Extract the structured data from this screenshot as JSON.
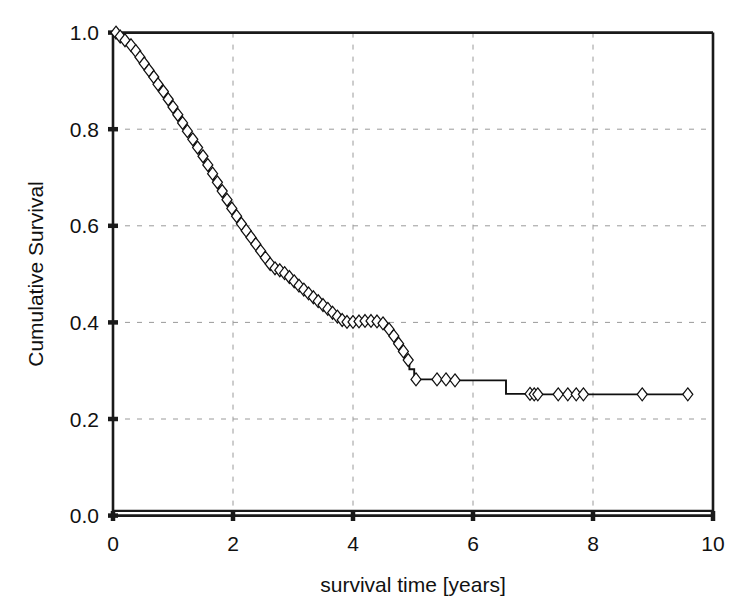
{
  "chart_data": {
    "type": "line",
    "subtype": "kaplan-meier-survival-step",
    "title": "",
    "xlabel": "survival time [years]",
    "ylabel": "Cumulative Survival",
    "xlim": [
      0,
      10
    ],
    "ylim": [
      0.0,
      1.0
    ],
    "xticks": [
      0,
      2,
      4,
      6,
      8,
      10
    ],
    "xtick_labels": [
      "0",
      "2",
      "4",
      "6",
      "8",
      "10"
    ],
    "yticks": [
      0.0,
      0.2,
      0.4,
      0.6,
      0.8,
      1.0
    ],
    "ytick_labels": [
      "0.0",
      "0.2",
      "0.4",
      "0.6",
      "0.8",
      "1.0"
    ],
    "grid": true,
    "grid_style": "dashed",
    "grid_color": "#9a9a9a",
    "legend": "none",
    "line_color": "#101010",
    "marker": "open-diamond",
    "marker_meaning": "censored observation",
    "series": [
      {
        "name": "Cumulative Survival",
        "x": [
          0.0,
          0.08,
          0.16,
          0.24,
          0.32,
          0.4,
          0.48,
          0.56,
          0.64,
          0.72,
          0.8,
          0.88,
          0.96,
          1.04,
          1.12,
          1.2,
          1.28,
          1.36,
          1.44,
          1.52,
          1.6,
          1.68,
          1.76,
          1.84,
          1.92,
          2.0,
          2.08,
          2.16,
          2.24,
          2.32,
          2.4,
          2.48,
          2.56,
          2.64,
          2.72,
          2.8,
          2.88,
          2.96,
          3.04,
          3.12,
          3.2,
          3.28,
          3.36,
          3.44,
          3.52,
          3.6,
          3.68,
          3.76,
          3.84,
          3.95,
          4.05,
          4.15,
          4.25,
          4.35,
          4.45,
          4.55,
          4.62,
          4.7,
          4.78,
          4.86,
          4.94,
          5.02,
          5.6,
          6.2,
          6.55,
          7.0,
          7.5,
          8.0,
          8.8,
          9.6
        ],
        "y": [
          1.0,
          0.992,
          0.984,
          0.974,
          0.962,
          0.949,
          0.936,
          0.922,
          0.908,
          0.893,
          0.878,
          0.862,
          0.846,
          0.83,
          0.813,
          0.796,
          0.779,
          0.762,
          0.744,
          0.726,
          0.708,
          0.69,
          0.672,
          0.654,
          0.636,
          0.62,
          0.604,
          0.59,
          0.576,
          0.562,
          0.548,
          0.534,
          0.521,
          0.512,
          0.508,
          0.502,
          0.494,
          0.485,
          0.476,
          0.468,
          0.46,
          0.452,
          0.444,
          0.436,
          0.428,
          0.42,
          0.412,
          0.405,
          0.401,
          0.401,
          0.402,
          0.403,
          0.403,
          0.402,
          0.398,
          0.386,
          0.372,
          0.356,
          0.34,
          0.322,
          0.303,
          0.282,
          0.28,
          0.28,
          0.252,
          0.251,
          0.251,
          0.251,
          0.251,
          0.251
        ]
      }
    ],
    "censored_x": [
      0.05,
      0.12,
      0.2,
      0.3,
      0.38,
      0.45,
      0.52,
      0.6,
      0.68,
      0.75,
      0.84,
      0.92,
      1.0,
      1.08,
      1.16,
      1.24,
      1.33,
      1.41,
      1.5,
      1.58,
      1.66,
      1.74,
      1.82,
      1.9,
      1.98,
      2.06,
      2.14,
      2.22,
      2.3,
      2.38,
      2.46,
      2.54,
      2.62,
      2.7,
      2.78,
      2.86,
      2.94,
      3.02,
      3.1,
      3.18,
      3.26,
      3.34,
      3.42,
      3.5,
      3.58,
      3.66,
      3.74,
      3.82,
      3.9,
      4.0,
      4.1,
      4.2,
      4.3,
      4.4,
      4.5,
      4.6,
      4.68,
      4.76,
      4.84,
      4.92,
      5.05,
      5.4,
      5.55,
      5.7,
      6.95,
      7.02,
      7.08,
      7.42,
      7.58,
      7.72,
      7.84,
      8.82,
      9.58
    ]
  },
  "axes": {
    "y_axis_title": "Cumulative Survival",
    "x_axis_title": "survival time [years]"
  }
}
